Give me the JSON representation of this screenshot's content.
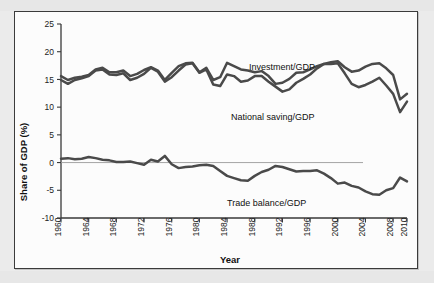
{
  "figure": {
    "frame_border_color": "#3b3b3b",
    "page_background": "#ebebeb",
    "plot_background": "#fcfcfc"
  },
  "chart_data": {
    "type": "line",
    "title": "",
    "xlabel": "Year",
    "ylabel": "Share of GDP (%)",
    "xlim": [
      1960,
      2010
    ],
    "ylim": [
      -10,
      25
    ],
    "ytick_labels": [
      "25",
      "20",
      "15",
      "10",
      "5",
      "0",
      "-5",
      "-10"
    ],
    "ytick_values": [
      25,
      20,
      15,
      10,
      5,
      0,
      -5,
      -10
    ],
    "xtick_labels": [
      "1960",
      "1964",
      "1968",
      "1972",
      "1976",
      "1980",
      "1984",
      "1988",
      "1992",
      "1996",
      "2000",
      "2004",
      "2008",
      "2010"
    ],
    "xtick_values": [
      1960,
      1964,
      1968,
      1972,
      1976,
      1980,
      1984,
      1988,
      1992,
      1996,
      2000,
      2004,
      2008,
      2010
    ],
    "grid": false,
    "legend_position": "inline-annotations",
    "zero_reference_line": 0,
    "line_color": "#4a4a4a",
    "x": [
      1960,
      1961,
      1962,
      1963,
      1964,
      1965,
      1966,
      1967,
      1968,
      1969,
      1970,
      1971,
      1972,
      1973,
      1974,
      1975,
      1976,
      1977,
      1978,
      1979,
      1980,
      1981,
      1982,
      1983,
      1984,
      1985,
      1986,
      1987,
      1988,
      1989,
      1990,
      1991,
      1992,
      1993,
      1994,
      1995,
      1996,
      1997,
      1998,
      1999,
      2000,
      2001,
      2002,
      2003,
      2004,
      2005,
      2006,
      2007,
      2008,
      2009,
      2010
    ],
    "series": [
      {
        "name": "Investment/GDP",
        "label": "Investment/GDP",
        "values": [
          15.6,
          14.9,
          15.3,
          15.5,
          15.8,
          16.8,
          17.1,
          16.3,
          16.3,
          16.6,
          15.6,
          16.0,
          16.7,
          17.2,
          16.6,
          14.9,
          16.2,
          17.4,
          17.9,
          18.0,
          16.3,
          17.1,
          14.9,
          15.4,
          18.0,
          17.4,
          16.8,
          16.6,
          16.3,
          16.5,
          15.6,
          14.2,
          14.4,
          15.1,
          16.2,
          16.3,
          16.8,
          17.4,
          17.8,
          18.1,
          18.3,
          17.2,
          16.4,
          16.6,
          17.3,
          17.8,
          17.9,
          17.0,
          15.8,
          11.4,
          12.4
        ],
        "color": "#4a4a4a"
      },
      {
        "name": "National saving/GDP",
        "label": "National saving/GDP",
        "values": [
          14.9,
          14.2,
          14.9,
          15.2,
          15.6,
          16.6,
          16.8,
          15.9,
          15.8,
          16.1,
          14.9,
          15.3,
          16.0,
          17.1,
          16.4,
          14.6,
          15.4,
          16.6,
          17.7,
          17.9,
          16.2,
          16.8,
          14.1,
          13.8,
          15.9,
          15.6,
          14.6,
          14.8,
          15.6,
          15.6,
          14.6,
          13.7,
          12.8,
          13.2,
          14.4,
          15.1,
          15.9,
          17.0,
          17.8,
          17.8,
          17.9,
          16.1,
          14.2,
          13.6,
          14.0,
          14.6,
          15.3,
          13.9,
          12.4,
          9.1,
          11.0
        ],
        "color": "#4a4a4a"
      },
      {
        "name": "Trade balance/GDP",
        "label": "Trade balance/GDP",
        "values": [
          0.7,
          0.8,
          0.6,
          0.7,
          1.0,
          0.8,
          0.5,
          0.4,
          0.1,
          0.1,
          0.2,
          -0.1,
          -0.4,
          0.5,
          0.2,
          1.2,
          -0.3,
          -1.0,
          -0.8,
          -0.7,
          -0.5,
          -0.4,
          -0.6,
          -1.5,
          -2.4,
          -2.8,
          -3.2,
          -3.3,
          -2.4,
          -1.7,
          -1.3,
          -0.6,
          -0.8,
          -1.2,
          -1.6,
          -1.5,
          -1.5,
          -1.4,
          -2.0,
          -2.8,
          -3.8,
          -3.6,
          -4.2,
          -4.5,
          -5.2,
          -5.7,
          -5.8,
          -5.0,
          -4.6,
          -2.7,
          -3.4
        ],
        "color": "#4a4a4a"
      }
    ],
    "annotations": [
      {
        "name": "investment-label",
        "text": "Investment/GDP",
        "x_px": 234,
        "y_px": 58
      },
      {
        "name": "national-saving-label",
        "text": "National saving/GDP",
        "x_px": 216,
        "y_px": 108
      },
      {
        "name": "trade-balance-label",
        "text": "Trade balance/GDP",
        "x_px": 212,
        "y_px": 194
      }
    ]
  }
}
